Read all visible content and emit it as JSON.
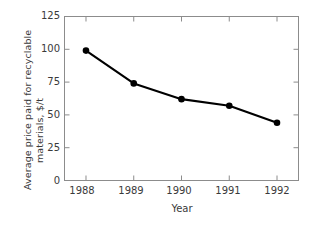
{
  "chart_data": {
    "type": "line",
    "title": "",
    "xlabel": "Year",
    "ylabel": "Average price paid for recyclable materials, $/t",
    "ylabel_lines": [
      "Average price paid for recyclable",
      "materials, $/t"
    ],
    "categories": [
      "1988",
      "1989",
      "1990",
      "1991",
      "1992"
    ],
    "x": [
      1988,
      1989,
      1990,
      1991,
      1992
    ],
    "values": [
      99,
      74,
      62,
      57,
      44
    ],
    "series": [
      {
        "name": "Average price paid for recyclable materials",
        "values": [
          99,
          74,
          62,
          57,
          44
        ]
      }
    ],
    "xlim": [
      1987.55,
      1992.45
    ],
    "ylim": [
      0,
      125
    ],
    "yticks": [
      0,
      25,
      50,
      75,
      100,
      125
    ],
    "ytick_labels": [
      "0",
      "25",
      "50",
      "75",
      "100",
      "125"
    ],
    "xticks": [
      1988,
      1989,
      1990,
      1991,
      1992
    ],
    "xtick_labels": [
      "1988",
      "1989",
      "1990",
      "1991",
      "1992"
    ],
    "grid": false,
    "legend": false,
    "marker": "filled-circle",
    "line_color": "#000000",
    "marker_color": "#000000",
    "frame_color": "#8c8c8c",
    "text_color": "#3a3a3a",
    "background": "#ffffff"
  }
}
